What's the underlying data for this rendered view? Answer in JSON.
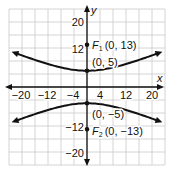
{
  "chart_data": {
    "type": "line",
    "title": "",
    "xlabel": "x",
    "ylabel": "y",
    "xlim": [
      -24,
      24
    ],
    "ylim": [
      -24,
      24
    ],
    "grid": true,
    "grid_step": 4,
    "x_ticks": [
      -20,
      -12,
      -4,
      4,
      12,
      20
    ],
    "y_ticks": [
      20,
      12,
      -12,
      -20
    ],
    "equation": "y^2/25 - x^2/144 = 1",
    "series": [
      {
        "name": "upper branch",
        "x": [
          -23,
          -20,
          -16,
          -12,
          -8,
          -4,
          0,
          4,
          8,
          12,
          16,
          20,
          23
        ],
        "y": [
          10.8,
          9.7,
          8.3,
          7.1,
          5.9,
          5.3,
          5,
          5.3,
          5.9,
          7.1,
          8.3,
          9.7,
          10.8
        ]
      },
      {
        "name": "lower branch",
        "x": [
          -23,
          -20,
          -16,
          -12,
          -8,
          -4,
          0,
          4,
          8,
          12,
          16,
          20,
          23
        ],
        "y": [
          -10.8,
          -9.7,
          -8.3,
          -7.1,
          -5.9,
          -5.3,
          -5,
          -5.3,
          -5.9,
          -7.1,
          -8.3,
          -9.7,
          -10.8
        ]
      }
    ],
    "points": [
      {
        "name": "F1",
        "label_main": "F",
        "label_sub": "1",
        "coords_text": "(0, 13)",
        "x": 0,
        "y": 13
      },
      {
        "name": "vertex-upper",
        "coords_text": "(0, 5)",
        "x": 0,
        "y": 5
      },
      {
        "name": "vertex-lower",
        "coords_text": "(0, −5)",
        "x": 0,
        "y": -5
      },
      {
        "name": "F2",
        "label_main": "F",
        "label_sub": "2",
        "coords_text": "(0, −13)",
        "x": 0,
        "y": -13
      }
    ],
    "tick_labels": {
      "x": [
        "−20",
        "−12",
        "−4",
        "4",
        "12",
        "20"
      ],
      "y_pos_20": "20",
      "y_pos_12": "12",
      "y_neg_12": "−12",
      "y_neg_20": "−20"
    },
    "colors": {
      "curve": "#111111",
      "grid": "#c9c9c9",
      "axis": "#111111"
    }
  }
}
